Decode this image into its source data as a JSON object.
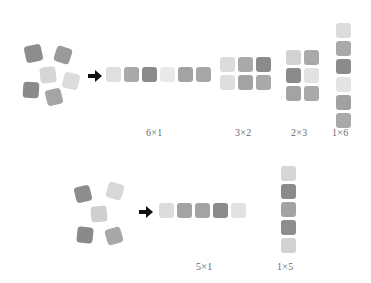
{
  "diagram": {
    "title_visible": false,
    "background_color": "#ffffff",
    "label_color": "#6b6b6b",
    "arrow_color": "#111111",
    "palette": {
      "very_light": "#e6e6e6",
      "light": "#d4d4d4",
      "medium_light": "#c9c9c9",
      "medium": "#a8a8a8",
      "medium_dark": "#9a9a9a",
      "dark": "#808080",
      "darker": "#777777"
    },
    "rows": [
      {
        "name": "row-six",
        "total": 6,
        "scatter": {
          "name": "scattered-group-six",
          "count": 6,
          "tiles": [
            {
              "x": 25,
              "y": 45,
              "size": 17,
              "rotate": -12,
              "color": "#8d8d8d"
            },
            {
              "x": 55,
              "y": 47,
              "size": 16,
              "rotate": 18,
              "color": "#9a9a9a"
            },
            {
              "x": 40,
              "y": 67,
              "size": 16,
              "rotate": -6,
              "color": "#d6d6d6"
            },
            {
              "x": 63,
              "y": 73,
              "size": 16,
              "rotate": 14,
              "color": "#dcdcdc"
            },
            {
              "x": 23,
              "y": 82,
              "size": 16,
              "rotate": 4,
              "color": "#8a8a8a"
            },
            {
              "x": 46,
              "y": 89,
              "size": 16,
              "rotate": -14,
              "color": "#a5a5a5"
            }
          ]
        },
        "arrow": {
          "name": "transform-arrow-six",
          "x": 88,
          "y": 70
        },
        "arrangements": [
          {
            "name": "arrangement-6x1",
            "label": "6×1",
            "cols": 6,
            "rows": 1,
            "origin_x": 106,
            "origin_y": 67,
            "size": 15,
            "gap": 3,
            "label_x": 146,
            "label_y": 127,
            "colors": [
              "#dfdfdf",
              "#a9a9a9",
              "#8b8b8b",
              "#e9e9e9",
              "#a3a3a3",
              "#a7a7a7"
            ]
          },
          {
            "name": "arrangement-3x2",
            "label": "3×2",
            "cols": 3,
            "rows": 2,
            "origin_x": 220,
            "origin_y": 57,
            "size": 15,
            "gap": 3,
            "label_x": 235,
            "label_y": 127,
            "colors": [
              "#dcdcdc",
              "#a9a9a9",
              "#8b8b8b",
              "#dedede",
              "#a3a3a3",
              "#a9a9a9"
            ]
          },
          {
            "name": "arrangement-2x3",
            "label": "2×3",
            "cols": 2,
            "rows": 3,
            "origin_x": 286,
            "origin_y": 50,
            "size": 15,
            "gap": 3,
            "label_x": 291,
            "label_y": 127,
            "colors": [
              "#d2d2d2",
              "#a9a9a9",
              "#8b8b8b",
              "#e2e2e2",
              "#a3a3a3",
              "#a9a9a9"
            ]
          },
          {
            "name": "arrangement-1x6",
            "label": "1×6",
            "cols": 1,
            "rows": 6,
            "origin_x": 336,
            "origin_y": 23,
            "size": 15,
            "gap": 3,
            "label_x": 332,
            "label_y": 127,
            "colors": [
              "#dcdcdc",
              "#a9a9a9",
              "#8b8b8b",
              "#e4e4e4",
              "#a1a1a1",
              "#a9a9a9"
            ]
          }
        ]
      },
      {
        "name": "row-five",
        "total": 5,
        "scatter": {
          "name": "scattered-group-five",
          "count": 5,
          "tiles": [
            {
              "x": 75,
              "y": 186,
              "size": 16,
              "rotate": -14,
              "color": "#8d8d8d"
            },
            {
              "x": 107,
              "y": 183,
              "size": 16,
              "rotate": 16,
              "color": "#d8d8d8"
            },
            {
              "x": 91,
              "y": 206,
              "size": 16,
              "rotate": -5,
              "color": "#cfcfcf"
            },
            {
              "x": 77,
              "y": 227,
              "size": 16,
              "rotate": 6,
              "color": "#8a8a8a"
            },
            {
              "x": 106,
              "y": 228,
              "size": 16,
              "rotate": -16,
              "color": "#a8a8a8"
            }
          ]
        },
        "arrow": {
          "name": "transform-arrow-five",
          "x": 139,
          "y": 206
        },
        "arrangements": [
          {
            "name": "arrangement-5x1",
            "label": "5×1",
            "cols": 5,
            "rows": 1,
            "origin_x": 159,
            "origin_y": 203,
            "size": 15,
            "gap": 3,
            "label_x": 196,
            "label_y": 261,
            "colors": [
              "#dcdcdc",
              "#a3a3a3",
              "#a3a3a3",
              "#8b8b8b",
              "#e2e2e2"
            ]
          },
          {
            "name": "arrangement-1x5",
            "label": "1×5",
            "cols": 1,
            "rows": 5,
            "origin_x": 281,
            "origin_y": 166,
            "size": 15,
            "gap": 3,
            "label_x": 277,
            "label_y": 261,
            "colors": [
              "#d6d6d6",
              "#8b8b8b",
              "#a3a3a3",
              "#8d8d8d",
              "#d2d2d2"
            ]
          }
        ]
      }
    ]
  }
}
